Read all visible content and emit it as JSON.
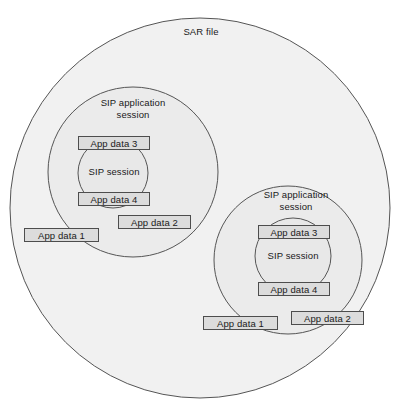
{
  "diagram": {
    "title": "SAR file",
    "colors": {
      "circle_fill": "#e6e6e6",
      "circle_stroke": "#555555",
      "box_fill": "#dcdcdc",
      "box_stroke": "#4d4d4d",
      "text": "#1a1a1a",
      "background": "#ffffff"
    },
    "outer": {
      "label": "SAR file"
    },
    "sessions": [
      {
        "id": "left",
        "app_session_label": "SIP application\nsession",
        "sip_session_label": "SIP session",
        "boxes": {
          "app_data_3": "App data 3",
          "app_data_4": "App data 4",
          "app_data_1": "App data 1",
          "app_data_2": "App data 2"
        }
      },
      {
        "id": "right",
        "app_session_label": "SIP application\nsession",
        "sip_session_label": "SIP session",
        "boxes": {
          "app_data_3": "App data 3",
          "app_data_4": "App data 4",
          "app_data_1": "App data 1",
          "app_data_2": "App data 2"
        }
      }
    ]
  }
}
